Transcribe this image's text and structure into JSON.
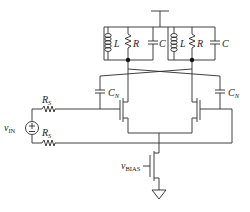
{
  "diagram": {
    "type": "circuit-schematic",
    "labels": {
      "inductor": "L",
      "resistor": "R",
      "capacitor": "C",
      "neutralization_cap_base": "C",
      "neutralization_cap_sub": "N",
      "source_resistor_base": "R",
      "source_resistor_sub": "S",
      "input_source_base": "v",
      "input_source_sub": "IN",
      "bias_base": "v",
      "bias_sub": "BIAS"
    },
    "components": [
      {
        "id": "tank-left",
        "elements": [
          "L",
          "R",
          "C"
        ]
      },
      {
        "id": "tank-right",
        "elements": [
          "L",
          "R",
          "C"
        ]
      },
      {
        "id": "cn-left",
        "label": "CN"
      },
      {
        "id": "cn-right",
        "label": "CN"
      },
      {
        "id": "rs-top",
        "label": "RS"
      },
      {
        "id": "rs-bottom",
        "label": "RS"
      },
      {
        "id": "vin",
        "label": "vIN"
      },
      {
        "id": "m-left",
        "type": "nmos"
      },
      {
        "id": "m-right",
        "type": "nmos"
      },
      {
        "id": "m-tail",
        "type": "nmos",
        "gate": "vBIAS"
      },
      {
        "id": "vdd",
        "type": "supply"
      },
      {
        "id": "gnd",
        "type": "ground"
      }
    ],
    "colors": {
      "wire": "#2a2a2a",
      "background": "#ffffff"
    }
  }
}
